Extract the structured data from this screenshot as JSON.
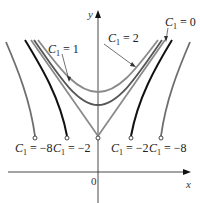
{
  "figure": {
    "axes": {
      "x_label": "x",
      "y_label": "y",
      "origin_label": "0"
    },
    "colors": {
      "axis": "#333333",
      "c_neg8": "#6e6e6e",
      "c_neg2": "#111111",
      "c_0": "#8a8a8a",
      "c_1": "#555555",
      "c_2": "#8a8a8a"
    },
    "labels": {
      "c1_eq_1": {
        "var": "C",
        "sub": "1",
        "rest": " = 1"
      },
      "c1_eq_2": {
        "var": "C",
        "sub": "1",
        "rest": " = 2"
      },
      "c1_eq_0": {
        "var": "C",
        "sub": "1",
        "rest": " = 0"
      },
      "c1_eq_neg8_left": {
        "var": "C",
        "sub": "1",
        "rest": " = −8"
      },
      "c1_eq_neg2_left": {
        "var": "C",
        "sub": "1",
        "rest": " = −2"
      },
      "c1_eq_neg2_right": {
        "var": "C",
        "sub": "1",
        "rest": " = −2"
      },
      "c1_eq_neg8_right": {
        "var": "C",
        "sub": "1",
        "rest": " = −8"
      }
    },
    "curves": [
      {
        "name": "C1 = -8",
        "c1": -8,
        "branches": 2,
        "endpoint": "open-circle"
      },
      {
        "name": "C1 = -2",
        "c1": -2,
        "branches": 2,
        "endpoint": "open-circle"
      },
      {
        "name": "C1 = 0",
        "c1": 0,
        "shape": "V",
        "vertex": "open-circle"
      },
      {
        "name": "C1 = 1",
        "c1": 1,
        "shape": "U"
      },
      {
        "name": "C1 = 2",
        "c1": 2,
        "shape": "U"
      }
    ]
  }
}
